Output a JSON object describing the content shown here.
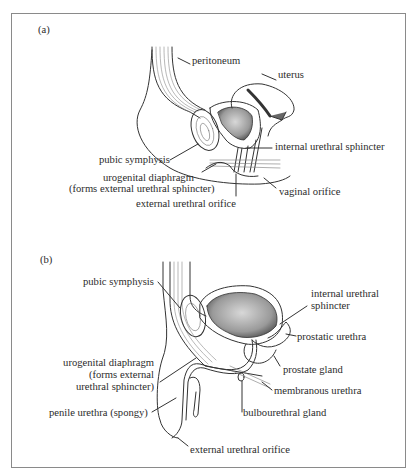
{
  "figure": {
    "panel_a": {
      "tag": "(a)",
      "labels": {
        "peritoneum": "peritoneum",
        "uterus": "uterus",
        "internal_urethral_sphincter": "internal urethral sphincter",
        "pubic_symphysis": "pubic symphysis",
        "urogenital_diaphragm_1": "urogenital diaphragm",
        "urogenital_diaphragm_2": "(forms external urethral sphincter)",
        "vaginal_orifice": "vaginal orifice",
        "external_urethral_orifice": "external urethral orifice"
      }
    },
    "panel_b": {
      "tag": "(b)",
      "labels": {
        "pubic_symphysis": "pubic symphysis",
        "internal_urethral_sphincter_1": "internal urethral",
        "internal_urethral_sphincter_2": "sphincter",
        "prostatic_urethra": "prostatic urethra",
        "prostate_gland": "prostate gland",
        "urogenital_diaphragm_1": "urogenital diaphragm",
        "urogenital_diaphragm_2": "(forms external",
        "urogenital_diaphragm_3": "urethral sphincter)",
        "membranous_urethra": "membranous urethra",
        "penile_urethra": "penile urethra (spongy)",
        "bulbourethral_gland": "bulbourethral gland",
        "external_urethral_orifice": "external urethral orifice"
      }
    }
  }
}
